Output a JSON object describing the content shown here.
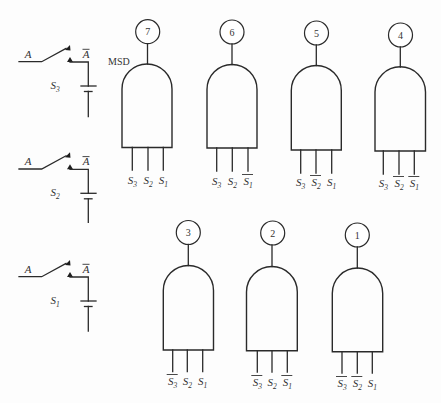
{
  "figure": {
    "msd_label": "MSD",
    "switches": [
      {
        "input_label": "A",
        "output_label": "A",
        "output_complement": true,
        "name_symbol": "S",
        "name_sub": "3"
      },
      {
        "input_label": "A",
        "output_label": "A",
        "output_complement": true,
        "name_symbol": "S",
        "name_sub": "2"
      },
      {
        "input_label": "A",
        "output_label": "A",
        "output_complement": true,
        "name_symbol": "S",
        "name_sub": "1"
      }
    ],
    "gates": [
      {
        "number": "7",
        "inputs": [
          {
            "symbol": "S",
            "sub": "3",
            "complement": false
          },
          {
            "symbol": "S",
            "sub": "2",
            "complement": false
          },
          {
            "symbol": "S",
            "sub": "1",
            "complement": false
          }
        ]
      },
      {
        "number": "6",
        "inputs": [
          {
            "symbol": "S",
            "sub": "3",
            "complement": false
          },
          {
            "symbol": "S",
            "sub": "2",
            "complement": false
          },
          {
            "symbol": "S",
            "sub": "1",
            "complement": true
          }
        ]
      },
      {
        "number": "5",
        "inputs": [
          {
            "symbol": "S",
            "sub": "3",
            "complement": false
          },
          {
            "symbol": "S",
            "sub": "2",
            "complement": true
          },
          {
            "symbol": "S",
            "sub": "1",
            "complement": false
          }
        ]
      },
      {
        "number": "4",
        "inputs": [
          {
            "symbol": "S",
            "sub": "3",
            "complement": false
          },
          {
            "symbol": "S",
            "sub": "2",
            "complement": true
          },
          {
            "symbol": "S",
            "sub": "1",
            "complement": true
          }
        ]
      },
      {
        "number": "3",
        "inputs": [
          {
            "symbol": "S",
            "sub": "3",
            "complement": true
          },
          {
            "symbol": "S",
            "sub": "2",
            "complement": false
          },
          {
            "symbol": "S",
            "sub": "1",
            "complement": false
          }
        ]
      },
      {
        "number": "2",
        "inputs": [
          {
            "symbol": "S",
            "sub": "3",
            "complement": true
          },
          {
            "symbol": "S",
            "sub": "2",
            "complement": false
          },
          {
            "symbol": "S",
            "sub": "1",
            "complement": true
          }
        ]
      },
      {
        "number": "1",
        "inputs": [
          {
            "symbol": "S",
            "sub": "3",
            "complement": true
          },
          {
            "symbol": "S",
            "sub": "2",
            "complement": true
          },
          {
            "symbol": "S",
            "sub": "1",
            "complement": false
          }
        ]
      }
    ]
  }
}
